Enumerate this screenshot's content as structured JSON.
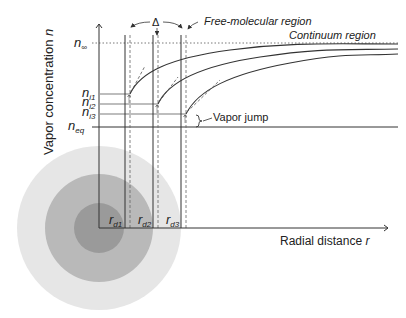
{
  "diagram": {
    "y_axis_label": "Vapor concentration ",
    "y_axis_var": "n",
    "x_axis_label": "Radial distance ",
    "x_axis_var": "r",
    "n_inf": {
      "base": "n",
      "sub": "∞"
    },
    "n_eq": {
      "base": "n",
      "sub": "eq"
    },
    "n_i": [
      {
        "base": "n",
        "sub": "i1"
      },
      {
        "base": "n",
        "sub": "i2"
      },
      {
        "base": "n",
        "sub": "i3"
      }
    ],
    "r_d": [
      {
        "base": "r",
        "sub": "d1"
      },
      {
        "base": "r",
        "sub": "d2"
      },
      {
        "base": "r",
        "sub": "d3"
      }
    ],
    "delta_label": "Δ",
    "free_molecular_label": "Free-molecular region",
    "continuum_label": "Continuum region",
    "vapor_jump_label": "Vapor jump",
    "colors": {
      "outer_shell": "#e6e6e6",
      "middle_shell": "#b9b9b9",
      "inner_core": "#9a9a9a",
      "line": "#333333"
    }
  }
}
